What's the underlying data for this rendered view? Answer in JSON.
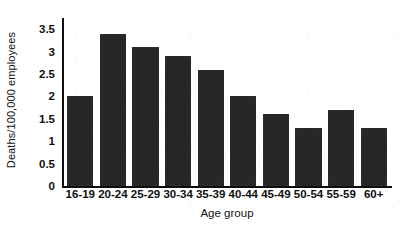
{
  "chart_data": {
    "type": "bar",
    "title": "",
    "xlabel": "Age group",
    "ylabel": "Deaths/100,000 employees",
    "categories": [
      "16-19",
      "20-24",
      "25-29",
      "30-34",
      "35-39",
      "40-44",
      "45-49",
      "50-54",
      "55-59",
      "60+"
    ],
    "values": [
      2.0,
      3.4,
      3.1,
      2.9,
      2.6,
      2.0,
      1.6,
      1.3,
      1.7,
      1.3
    ],
    "ylim": [
      0,
      3.75
    ],
    "yticks": [
      0,
      0.5,
      1,
      1.5,
      2,
      2.5,
      3,
      3.5
    ],
    "ytick_labels": [
      "0",
      "0.5",
      "1",
      "1.5",
      "2",
      "2.5",
      "3",
      "3.5"
    ],
    "grid": false,
    "legend": null,
    "bar_color": "#242424",
    "axis_color": "#0d0d0d",
    "background_color": "#ffffff"
  }
}
